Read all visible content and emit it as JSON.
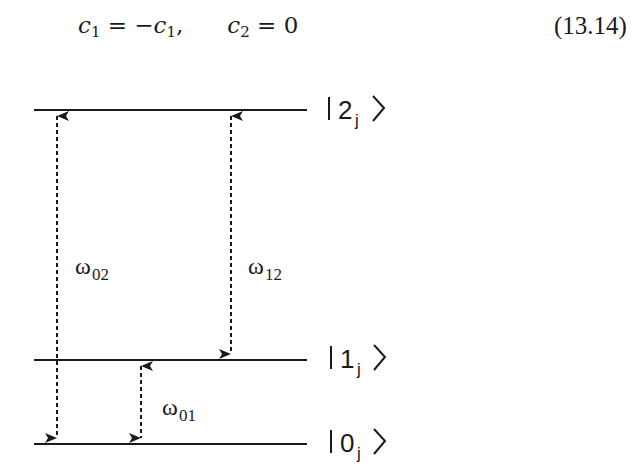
{
  "equation": {
    "lhs1": "c",
    "lhs1_sub": "1",
    "eq1": " = −",
    "rhs1": "c",
    "rhs1_sub": "1",
    "comma": ",",
    "lhs2": "c",
    "lhs2_sub": "2",
    "rhs2": " = 0",
    "number": "(13.14)"
  },
  "diagram": {
    "levels": [
      {
        "state": "2",
        "sub": "j",
        "y": 110
      },
      {
        "state": "1",
        "sub": "j",
        "y": 360
      },
      {
        "state": "0",
        "sub": "j",
        "y": 444
      }
    ],
    "transitions": [
      {
        "label": "ω",
        "sub": "02",
        "from": "0",
        "to": "2"
      },
      {
        "label": "ω",
        "sub": "12",
        "from": "1",
        "to": "2"
      },
      {
        "label": "ω",
        "sub": "01",
        "from": "0",
        "to": "1"
      }
    ],
    "line_color": "#1a1a1a"
  }
}
